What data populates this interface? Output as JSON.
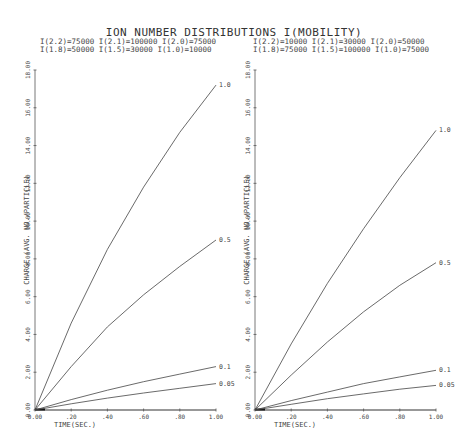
{
  "header": {
    "title": "ION NUMBER DISTRIBUTIONS   I(MOBILITY)"
  },
  "panels": [
    {
      "params_line1": "I(2.2)=75000 I(2.1)=100000 I(2.0)=75000",
      "params_line2": "I(1.8)=50000 I(1.5)=30000 I(1.0)=10000"
    },
    {
      "params_line1": "I(2.2)=10000 I(2.1)=30000 I(2.0)=50000",
      "params_line2": "I(1.8)=75000 I(1.5)=100000 I(1.0)=75000"
    }
  ],
  "chart_data": [
    {
      "type": "line",
      "title": "ION NUMBER DISTRIBUTIONS I(MOBILITY) — left panel",
      "subtitle": "I(2.2)=75000 I(2.1)=100000 I(2.0)=75000 I(1.8)=50000 I(1.5)=30000 I(1.0)=10000",
      "xlabel": "TIME(SEC.)",
      "ylabel": "CHARGE (AVG. NO./PARTICLE)",
      "xlim": [
        0,
        1
      ],
      "ylim": [
        0,
        18
      ],
      "x_ticks": [
        "0.00",
        ".20",
        ".40",
        ".60",
        ".80",
        "1.00"
      ],
      "y_ticks": [
        "0.00",
        "2.00",
        "4.00",
        "6.00",
        "8.00",
        "10.00",
        "12.00",
        "14.00",
        "16.00",
        "18.00"
      ],
      "grid": false,
      "legend": "inline labels at curve ends",
      "x": [
        0,
        0.2,
        0.4,
        0.6,
        0.8,
        1.0
      ],
      "series": [
        {
          "name": "1.0",
          "values": [
            0,
            4.6,
            8.5,
            11.8,
            14.7,
            17.2
          ]
        },
        {
          "name": "0.5",
          "values": [
            0,
            2.3,
            4.4,
            6.1,
            7.6,
            9.0
          ]
        },
        {
          "name": "0.1",
          "values": [
            0,
            0.55,
            1.05,
            1.5,
            1.9,
            2.3
          ]
        },
        {
          "name": "0.05",
          "values": [
            0,
            0.33,
            0.63,
            0.9,
            1.15,
            1.4
          ]
        }
      ]
    },
    {
      "type": "line",
      "title": "ION NUMBER DISTRIBUTIONS I(MOBILITY) — right panel",
      "subtitle": "I(2.2)=10000 I(2.1)=30000 I(2.0)=50000 I(1.8)=75000 I(1.5)=100000 I(1.0)=75000",
      "xlabel": "TIME(SEC.)",
      "ylabel": "CHARGE (AVG. NO./PARTICLE)",
      "xlim": [
        0,
        1
      ],
      "ylim": [
        0,
        18
      ],
      "x_ticks": [
        "0.00",
        ".20",
        ".40",
        ".60",
        ".80",
        "1.00"
      ],
      "y_ticks": [
        "0.00",
        "2.00",
        "4.00",
        "6.00",
        "8.00",
        "10.00",
        "12.00",
        "14.00",
        "16.00",
        "18.00"
      ],
      "grid": false,
      "legend": "inline labels at curve ends",
      "x": [
        0,
        0.2,
        0.4,
        0.6,
        0.8,
        1.0
      ],
      "series": [
        {
          "name": "1.0",
          "values": [
            0,
            3.5,
            6.7,
            9.6,
            12.3,
            14.8
          ]
        },
        {
          "name": "0.5",
          "values": [
            0,
            1.85,
            3.6,
            5.2,
            6.6,
            7.8
          ]
        },
        {
          "name": "0.1",
          "values": [
            0,
            0.5,
            0.95,
            1.4,
            1.75,
            2.1
          ]
        },
        {
          "name": "0.05",
          "values": [
            0,
            0.3,
            0.6,
            0.85,
            1.1,
            1.3
          ]
        }
      ]
    }
  ]
}
